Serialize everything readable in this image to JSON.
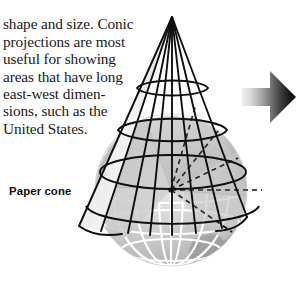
{
  "figure": {
    "background_color": "#ffffff",
    "width": 300,
    "height": 287,
    "body_text": "shape and size. Conic\nprojections are most\nuseful for showing\nareas that have long\neast-west dimen-\nsions, such as the\nUnited States.",
    "body_text_lines": [
      "shape and size. Conic",
      "projections are most",
      "useful for showing",
      "areas that have long",
      "east-west dimen-",
      "sions, such as the",
      "United States."
    ],
    "callout_label": "Paper cone",
    "text_color": "#1a1a1a",
    "label_color": "#111111",
    "line_color": "#101010",
    "globe_light": "#d8d8d8",
    "globe_mid": "#c4c4c4",
    "globe_dark": "#a9a9a9",
    "globe_grid_color": "#ffffff",
    "arrow_gradient_from": "#e3e3e3",
    "arrow_gradient_to": "#000000",
    "icons": {
      "cone": "paper-cone-wireframe",
      "globe": "globe-sphere-cutaway",
      "rays": "dashed-projection-rays",
      "arrow": "right-arrow-icon"
    }
  }
}
